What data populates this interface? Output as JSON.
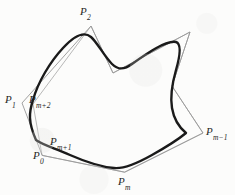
{
  "figure": {
    "kind": "geometry-diagram",
    "background_color": "#fcfcfb",
    "curve_color": "#1a1a1a",
    "polygon_color": "#8a8a8a",
    "label_color": "#262626",
    "curve_stroke_width": 2.4,
    "polygon_stroke_width": 0.8,
    "canvas": {
      "width": 235,
      "height": 195
    }
  },
  "control_polygon": {
    "name": "control-polygon",
    "closed": true,
    "vertices": [
      {
        "id": "P0",
        "base": "P",
        "sub": "0",
        "x": 42,
        "y": 155
      },
      {
        "id": "P1",
        "base": "P",
        "sub": "1",
        "x": 22,
        "y": 103
      },
      {
        "id": "P2",
        "base": "P",
        "sub": "2",
        "x": 91,
        "y": 26
      },
      {
        "id": "V3",
        "base": "",
        "sub": "",
        "x": 113,
        "y": 73
      },
      {
        "id": "V4",
        "base": "",
        "sub": "",
        "x": 190,
        "y": 32
      },
      {
        "id": "V5",
        "base": "",
        "sub": "",
        "x": 172,
        "y": 86
      },
      {
        "id": "Pm-1",
        "base": "P",
        "sub": "m−1",
        "x": 203,
        "y": 133
      },
      {
        "id": "Pm",
        "base": "P",
        "sub": "m",
        "x": 125,
        "y": 172
      },
      {
        "id": "Pm+1",
        "base": "P",
        "sub": "m+1",
        "x": 42,
        "y": 155
      },
      {
        "id": "Pm+2",
        "base": "P",
        "sub": "m+2",
        "x": 33,
        "y": 104
      }
    ],
    "path": "M 42 155 L 22 103 L 91 26 L 113 73 L 190 32 L 172 86 L 203 133 L 125 172 Z",
    "inner_path": "M 42 155 L 33 104 L 91 26 L 113 73 L 190 32 L 172 86 L 203 133 L 125 172 Z"
  },
  "curve": {
    "name": "b-spline-curve",
    "closed": true,
    "path": "M 36 140 C 28 122 29 112 33 100 C 38 82 50 62 63 48 C 74 36 84 31 91 37 C 97 42 104 56 112 64 C 118 70 124 70 132 64 C 146 54 166 40 176 42 C 182 44 180 56 176 70 C 172 84 170 96 172 108 C 174 120 180 128 186 133 C 180 138 168 146 152 155 C 136 164 124 169 114 168 C 102 167 86 162 70 155 C 54 148 43 145 36 140 Z"
  },
  "labels": [
    {
      "id": "P2",
      "base": "P",
      "sub": "2",
      "x": 80,
      "y": 6,
      "align": "left"
    },
    {
      "id": "P1",
      "base": "P",
      "sub": "1",
      "x": 5,
      "y": 94,
      "align": "left"
    },
    {
      "id": "Pm+2",
      "base": "P",
      "sub": "m+2",
      "x": 29,
      "y": 94,
      "align": "left"
    },
    {
      "id": "Pm-1",
      "base": "P",
      "sub": "m−1",
      "x": 206,
      "y": 126,
      "align": "left"
    },
    {
      "id": "Pm+1",
      "base": "P",
      "sub": "m+1",
      "x": 50,
      "y": 136,
      "align": "left"
    },
    {
      "id": "P0",
      "base": "P",
      "sub": "0",
      "x": 33,
      "y": 150,
      "align": "left"
    },
    {
      "id": "Pm",
      "base": "P",
      "sub": "m",
      "x": 118,
      "y": 176,
      "align": "left"
    }
  ]
}
